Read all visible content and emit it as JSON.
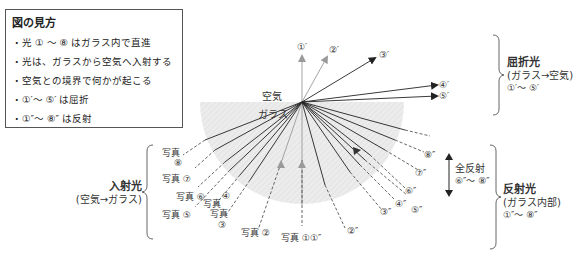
{
  "legend": {
    "title": "図の見方",
    "items": [
      "・光 ① ～ ⑧ はガラス内で直進",
      "・光は、ガラスから空気へ入射する",
      "・空気との境界で何かが起こる",
      "・①′～ ⑤′ は屈折",
      "・①″～ ⑧″ は反射"
    ]
  },
  "media": {
    "air": "空気",
    "glass": "ガラス"
  },
  "refracted_labels": [
    "①′",
    "②′",
    "③′",
    "④′",
    "⑤′"
  ],
  "reflected_labels": [
    "①″",
    "②″",
    "③″",
    "④″",
    "⑤″",
    "⑥″",
    "⑦″",
    "⑧″"
  ],
  "photo_labels": {
    "p1": "写真 ①",
    "p2": "写真 ②",
    "p3a": "写真",
    "p3b": "③",
    "p4a": "写真",
    "p4b": "④",
    "p5": "写真 ⑤",
    "p6": "写真 ⑥",
    "p7": "写真 ⑦",
    "p8a": "写真",
    "p8b": "⑧"
  },
  "groups": {
    "refracted": {
      "title": "屈折光",
      "sub": "(ガラス→空気)",
      "range": "①′～ ⑤′"
    },
    "incident": {
      "title": "入射光",
      "sub": "(空気→ガラス)"
    },
    "total_reflection": {
      "title": "全反射",
      "range": "⑥″～ ⑧″"
    },
    "reflected": {
      "title": "反射光",
      "sub": "(ガラス内部)",
      "range": "①″～ ⑧″"
    }
  },
  "colors": {
    "glass_fill": "#e9e9e9",
    "ray_dark": "#222222",
    "ray_gray": "#9a9a9a",
    "border": "#555555"
  }
}
